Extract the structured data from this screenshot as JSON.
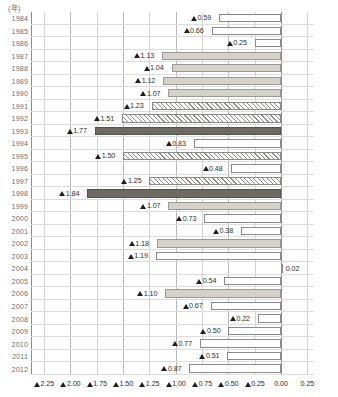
{
  "unit_label": "(年)",
  "chart_data": {
    "type": "bar",
    "orientation": "horizontal",
    "title": "",
    "xlabel": "",
    "ylabel": "(年)",
    "grid": true,
    "legend": null,
    "note": "Values shown with a filled triangle marker (▲) denote negative numbers; 0.02 in 2004 is positive.",
    "xlim": [
      -2.375,
      0.3125
    ],
    "xticks": [
      -2.25,
      -2.0,
      -1.75,
      -1.5,
      -1.25,
      -1.0,
      -0.75,
      -0.5,
      -0.25,
      0.0,
      0.25
    ],
    "xticklabels": [
      "▲2.25",
      "▲2.00",
      "▲1.75",
      "▲1.50",
      "▲1.25",
      "▲1.00",
      "▲0.75",
      "▲0.50",
      "▲0.25",
      "0.00",
      "0.25"
    ],
    "categories": [
      "1984",
      "1985",
      "1986",
      "1987",
      "1988",
      "1989",
      "1990",
      "1991",
      "1992",
      "1993",
      "1994",
      "1995",
      "1996",
      "1997",
      "1998",
      "1999",
      "2000",
      "2001",
      "2002",
      "2003",
      "2004",
      "2005",
      "2006",
      "2007",
      "2008",
      "2009",
      "2010",
      "2011",
      "2012"
    ],
    "values": [
      -0.59,
      -0.66,
      -0.25,
      -1.13,
      -1.04,
      -1.12,
      -1.07,
      -1.23,
      -1.51,
      -1.77,
      -0.83,
      -1.5,
      -0.48,
      -1.25,
      -1.84,
      -1.07,
      -0.73,
      -0.38,
      -1.18,
      -1.19,
      0.02,
      -0.54,
      -1.1,
      -0.67,
      -0.22,
      -0.5,
      -0.77,
      -0.51,
      -0.87
    ],
    "datalabels": [
      "▲0.59",
      "▲0.66",
      "▲0.25",
      "▲1.13",
      "▲1.04",
      "▲1.12",
      "▲1.07",
      "▲1.23",
      "▲1.51",
      "▲1.77",
      "▲0.83",
      "▲1.50",
      "▲0.48",
      "▲1.25",
      "▲1.84",
      "▲1.07",
      "▲0.73",
      "▲0.38",
      "▲1.18",
      "▲1.19",
      "0.02",
      "▲0.54",
      "▲1.10",
      "▲0.67",
      "▲0.22",
      "▲0.50",
      "▲0.77",
      "▲0.51",
      "▲0.87"
    ],
    "fills": [
      "white",
      "white",
      "white",
      "gray",
      "gray",
      "gray",
      "gray",
      "hatch",
      "hatch",
      "dark",
      "white",
      "hatch",
      "white",
      "hatch",
      "dark",
      "gray",
      "white",
      "white",
      "gray",
      "white",
      "white",
      "white",
      "gray",
      "white",
      "white",
      "white",
      "white",
      "white",
      "white"
    ]
  }
}
